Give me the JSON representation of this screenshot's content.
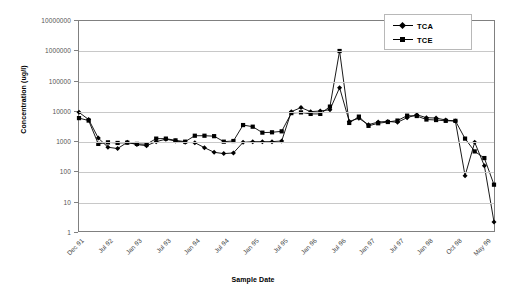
{
  "chart_data": {
    "type": "line",
    "title": "",
    "xlabel": "Sample Date",
    "ylabel": "Concentration (ug/l)",
    "yscale": "log",
    "ylim": [
      1,
      10000000
    ],
    "y_ticks": [
      1,
      10,
      100,
      1000,
      10000,
      100000,
      1000000,
      10000000
    ],
    "y_tick_labels": [
      "1",
      "10",
      "100",
      "1000",
      "10000",
      "100000",
      "1000000",
      "10000000"
    ],
    "grid": true,
    "legend_position": "top-right",
    "x_tick_labels": [
      "Dec 91",
      "Jul 92",
      "Jan 93",
      "Jul 93",
      "Jan 94",
      "Jul 94",
      "Jan 95",
      "Jul 95",
      "Jan 96",
      "Jul 96",
      "Jan 97",
      "Jul 97",
      "Jan 98",
      "Oct 98",
      "May 99"
    ],
    "x_tick_indices": [
      0,
      3,
      6,
      9,
      12,
      15,
      18,
      21,
      24,
      27,
      30,
      33,
      36,
      39,
      42
    ],
    "n_points": 44,
    "series": [
      {
        "name": "TCA",
        "marker": "diamond",
        "color": "#000000",
        "values": [
          9000,
          5200,
          1250,
          620,
          560,
          900,
          760,
          700,
          950,
          1150,
          1000,
          900,
          880,
          600,
          420,
          380,
          400,
          900,
          950,
          950,
          950,
          1000,
          9500,
          13000,
          9500,
          10000,
          11000,
          60000,
          4500,
          5700,
          3500,
          4300,
          4500,
          4200,
          6000,
          7500,
          6000,
          5800,
          5000,
          4600,
          70,
          900,
          150,
          2
        ]
      },
      {
        "name": "TCE",
        "marker": "square",
        "color": "#000000",
        "values": [
          5800,
          4800,
          800,
          900,
          860,
          880,
          800,
          780,
          1200,
          1200,
          1050,
          950,
          1500,
          1500,
          1450,
          950,
          1000,
          3400,
          3000,
          1900,
          1950,
          2100,
          8500,
          9000,
          8000,
          8000,
          14000,
          1000000,
          4000,
          6500,
          3200,
          3900,
          4300,
          4800,
          7000,
          6800,
          5200,
          5000,
          4700,
          4700,
          1200,
          450,
          270,
          35
        ]
      }
    ]
  },
  "legend": {
    "entries": [
      {
        "label": "TCA"
      },
      {
        "label": "TCE"
      }
    ]
  }
}
